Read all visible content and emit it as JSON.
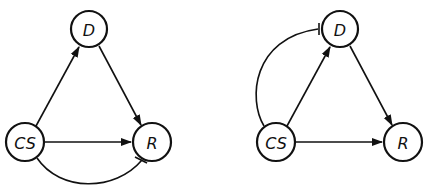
{
  "diagrams": [
    {
      "id": "left",
      "nodes": [
        {
          "key": "D",
          "label": "D"
        },
        {
          "key": "CS",
          "label": "CS"
        },
        {
          "key": "R",
          "label": "R"
        }
      ],
      "edges": [
        {
          "from": "CS",
          "to": "D",
          "type": "activation"
        },
        {
          "from": "D",
          "to": "R",
          "type": "activation"
        },
        {
          "from": "CS",
          "to": "R",
          "type": "activation"
        },
        {
          "from": "CS",
          "to": "R",
          "type": "inhibition",
          "route": "curved-below"
        }
      ]
    },
    {
      "id": "right",
      "nodes": [
        {
          "key": "D",
          "label": "D"
        },
        {
          "key": "CS",
          "label": "CS"
        },
        {
          "key": "R",
          "label": "R"
        }
      ],
      "edges": [
        {
          "from": "CS",
          "to": "D",
          "type": "activation"
        },
        {
          "from": "D",
          "to": "R",
          "type": "activation"
        },
        {
          "from": "CS",
          "to": "R",
          "type": "activation"
        },
        {
          "from": "CS",
          "to": "D",
          "type": "inhibition",
          "route": "curved-left"
        }
      ]
    }
  ]
}
